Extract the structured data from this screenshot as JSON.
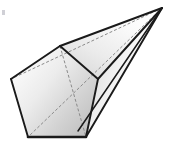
{
  "figure": {
    "title": "Pentagonal pyramid (oblique view)",
    "background_color": "#ffffff",
    "edge_color": "#1a1a1a",
    "hidden_edge_color": "#8a8a8a",
    "face_fill_light": "#ffffff",
    "face_fill_mid": "#e3e3e3",
    "face_fill_dark": "#bdbdbd",
    "stroke_width_visible": 1.9,
    "stroke_width_hidden": 1.0,
    "dash_pattern": "3 2",
    "vertices": {
      "apex": {
        "label": "apex",
        "x": 162,
        "y": 8
      },
      "base_top": {
        "label": "base-top",
        "x": 60,
        "y": 46
      },
      "base_left": {
        "label": "base-left",
        "x": 11,
        "y": 79
      },
      "base_bottom_left": {
        "label": "base-bottom-left",
        "x": 28,
        "y": 137
      },
      "base_bottom_right": {
        "label": "base-bottom-right",
        "x": 86,
        "y": 137
      },
      "base_right": {
        "label": "base-right",
        "x": 98,
        "y": 79
      }
    },
    "faces": [
      {
        "name": "base-pentagon",
        "fill": "#dcdcdc"
      },
      {
        "name": "upper-face",
        "fill": "#e8e8e8"
      },
      {
        "name": "right-face",
        "fill": "#efefef"
      },
      {
        "name": "lower-face",
        "fill": "#f2f2f2"
      }
    ],
    "edges": [
      {
        "name": "apex-to-base-top",
        "style": "solid"
      },
      {
        "name": "apex-to-base-right",
        "style": "solid"
      },
      {
        "name": "apex-to-base-bottom-right",
        "style": "solid"
      },
      {
        "name": "apex-to-base-left",
        "style": "dashed"
      },
      {
        "name": "apex-to-base-bottom-left",
        "style": "dashed"
      },
      {
        "name": "base-top-to-base-left",
        "style": "solid"
      },
      {
        "name": "base-left-to-base-bottom-left",
        "style": "solid"
      },
      {
        "name": "base-bottom-left-to-base-bottom-right",
        "style": "solid"
      },
      {
        "name": "base-bottom-right-to-base-right",
        "style": "solid"
      },
      {
        "name": "base-right-to-base-top",
        "style": "solid"
      },
      {
        "name": "base-top-to-base-bottom-right-diagonal",
        "style": "dashed"
      }
    ],
    "artifact": {
      "name": "corner-speck",
      "x": 2,
      "y": 12,
      "color": "#c8c8cf"
    }
  }
}
